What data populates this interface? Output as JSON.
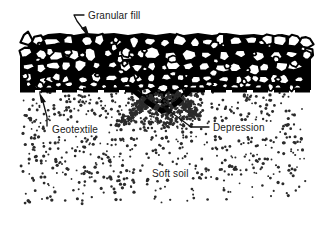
{
  "figure": {
    "type": "geotechnical-cross-section",
    "background_color": "#ffffff",
    "line_color": "#000000",
    "text_color": "#1a1a1a"
  },
  "labels": {
    "granular_fill": "Granular fill",
    "geotextile": "Geotextile",
    "depression": "Depression",
    "soft_soil": "Soft soil"
  },
  "layers": [
    {
      "name": "granular-fill",
      "label": "Granular fill",
      "description": "Angular aggregate stones drawn as white polygons with heavy black outlines",
      "top_y": 33,
      "bottom_y": 90,
      "left_x": 20,
      "right_x": 311
    },
    {
      "name": "geotextile",
      "label": "Geotextile",
      "description": "Thick black dashed horizontal line separating fill from soil",
      "y": 90,
      "left_x": 20,
      "right_x": 311,
      "dash_pattern": "14 6",
      "stroke_width": 5.2
    },
    {
      "name": "soft-soil",
      "label": "Soft soil",
      "description": "Random stipple dots",
      "top_y": 92,
      "bottom_y": 205,
      "left_x": 18,
      "right_x": 312
    },
    {
      "name": "depression",
      "label": "Depression",
      "description": "V-shaped dip where granular fill settles through the geotextile into soft soil",
      "center_x": 163,
      "top_y": 88,
      "bottom_y": 125
    }
  ],
  "annotations": [
    {
      "name": "granular-fill-callout",
      "text": "Granular fill",
      "text_x": 88,
      "text_y": 18,
      "leader_points": "84,15 74,15 78,22 88,36",
      "arrow_at": [
        88,
        36
      ]
    },
    {
      "name": "geotextile-callout",
      "text": "Geotextile",
      "text_x": 52,
      "text_y": 131,
      "leader_points": "46,125 46,116 40,95",
      "arrow_at": [
        40,
        95
      ]
    },
    {
      "name": "depression-callout",
      "text": "Depression",
      "text_x": 212,
      "text_y": 131,
      "leader_points": "208,127 190,127 162,106",
      "arrow_at": [
        162,
        106
      ]
    },
    {
      "name": "soft-soil-label",
      "text": "Soft soil",
      "text_x": 152,
      "text_y": 174
    }
  ]
}
